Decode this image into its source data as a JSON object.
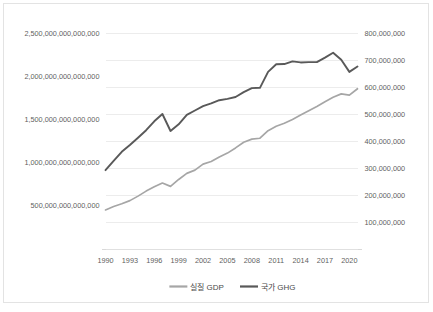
{
  "chart_data": {
    "type": "line",
    "title": "",
    "subtitle": "",
    "xlabel": "",
    "ylabel": "",
    "grid": true,
    "legend_position": "bottom",
    "x": [
      1990,
      1991,
      1992,
      1993,
      1994,
      1995,
      1996,
      1997,
      1998,
      1999,
      2000,
      2001,
      2002,
      2003,
      2004,
      2005,
      2006,
      2007,
      2008,
      2009,
      2010,
      2011,
      2012,
      2013,
      2014,
      2015,
      2016,
      2017,
      2018,
      2019,
      2020,
      2021
    ],
    "xtick_labels": [
      "1990",
      "1993",
      "1996",
      "1999",
      "2002",
      "2005",
      "2008",
      "2011",
      "2014",
      "2017",
      "2020"
    ],
    "xtick_values": [
      1990,
      1993,
      1996,
      1999,
      2002,
      2005,
      2008,
      2011,
      2014,
      2017,
      2020
    ],
    "xlim": [
      1990,
      2021
    ],
    "axes": [
      {
        "name": "left",
        "label": "",
        "tick_labels": [
          "500,000,000,000,000",
          "1,000,000,000,000,000",
          "1,500,000,000,000,000",
          "2,000,000,000,000,000",
          "2,500,000,000,000,000"
        ],
        "tick_values": [
          500000000000000,
          1000000000000000,
          1500000000000000,
          2000000000000000,
          2500000000000000
        ],
        "ylim": [
          0,
          2500000000000000
        ]
      },
      {
        "name": "right",
        "label": "",
        "tick_labels": [
          "100,000,000",
          "200,000,000",
          "300,000,000",
          "400,000,000",
          "500,000,000",
          "600,000,000",
          "700,000,000",
          "800,000,000"
        ],
        "tick_values": [
          100000000,
          200000000,
          300000000,
          400000000,
          500000000,
          600000000,
          700000000,
          800000000
        ],
        "ylim": [
          0,
          800000000
        ]
      }
    ],
    "series": [
      {
        "name": "실질 GDP",
        "axis": "left",
        "color": "#a6a6a6",
        "values": [
          452000000000000,
          492000000000000,
          523000000000000,
          560000000000000,
          612000000000000,
          670000000000000,
          720000000000000,
          764000000000000,
          725000000000000,
          805000000000000,
          875000000000000,
          913000000000000,
          983000000000000,
          1013000000000000,
          1065000000000000,
          1110000000000000,
          1170000000000000,
          1235000000000000,
          1272000000000000,
          1282000000000000,
          1370000000000000,
          1420000000000000,
          1455000000000000,
          1500000000000000,
          1550000000000000,
          1600000000000000,
          1650000000000000,
          1705000000000000,
          1757000000000000,
          1795000000000000,
          1780000000000000,
          1855000000000000
        ]
      },
      {
        "name": "국가 GHG",
        "axis": "right",
        "color": "#595959",
        "values": [
          292000000,
          326000000,
          360000000,
          385000000,
          412000000,
          440000000,
          473000000,
          500000000,
          437000000,
          462000000,
          497000000,
          513000000,
          529000000,
          539000000,
          551000000,
          556000000,
          563000000,
          581000000,
          596000000,
          597000000,
          656000000,
          684000000,
          685000000,
          695000000,
          691000000,
          692000000,
          692000000,
          709000000,
          727000000,
          701000000,
          656000000,
          676000000
        ]
      }
    ]
  },
  "legend": {
    "items": [
      {
        "label": "실질 GDP",
        "color": "#a6a6a6"
      },
      {
        "label": "국가 GHG",
        "color": "#595959"
      }
    ]
  },
  "colors": {
    "gdp": "#a6a6a6",
    "ghg": "#595959",
    "grid": "#ececec",
    "axis_text": "#5f5f5f",
    "border": "#e3e3e3",
    "background": "#ffffff"
  }
}
